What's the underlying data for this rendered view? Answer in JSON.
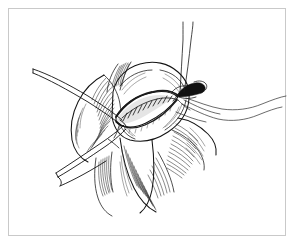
{
  "figure": {
    "medium": "pen-and-ink line drawing",
    "style": "black ink hatching on white",
    "frame": {
      "present": true,
      "border_color": "#c9c9c9",
      "background_color": "#ffffff",
      "inset_px": 8
    },
    "caption": "",
    "label_text": ""
  },
  "scene": {
    "subject": "vascular anastomosis with running suture closure",
    "structures": [
      {
        "id": "vessel-body",
        "name": "exposed vessel / tissue mass",
        "description": "central rounded structure with longitudinal incision"
      },
      {
        "id": "incision-opening",
        "name": "lens-shaped arteriotomy opening",
        "description": "open elliptical incision with everted edges"
      },
      {
        "id": "suture-line",
        "name": "running suture line",
        "stitch_count": 11,
        "description": "continuous stitches along the closed portion of the incision"
      },
      {
        "id": "tissue-flap-left",
        "name": "left retracted tissue flap",
        "shading": "dense parallel hatching"
      },
      {
        "id": "tissue-flap-right",
        "name": "right retracted tissue flap",
        "shading": "dense parallel hatching"
      },
      {
        "id": "tissue-flap-lower",
        "name": "lower tissue flap",
        "shading": "dense parallel hatching"
      },
      {
        "id": "cannula",
        "name": "cannula / shunt tube",
        "position": "upper right of incision",
        "fill": "solid dark"
      }
    ],
    "instruments": [
      {
        "id": "forceps-upper-left",
        "name": "fine forceps entering from upper left",
        "angle": "descending to the right"
      },
      {
        "id": "forceps-lower-left",
        "name": "second forceps / needle holder entering from lower left",
        "angle": "ascending to the right"
      }
    ],
    "sutures": [
      {
        "id": "suture-vertical-pair",
        "name": "paired suture threads drawn upward",
        "direction": "vertical, exiting top of frame"
      },
      {
        "id": "suture-tail-upper",
        "name": "upper suture tail trailing to the right",
        "direction": "wavy, exiting right side"
      },
      {
        "id": "suture-tail-lower",
        "name": "lower suture tail trailing to the right",
        "direction": "wavy, exiting right side"
      }
    ]
  },
  "colors": {
    "ink": "#1a1a1a",
    "hatching": "#2b2b2b",
    "frame_border": "#c9c9c9",
    "background": "#ffffff"
  }
}
